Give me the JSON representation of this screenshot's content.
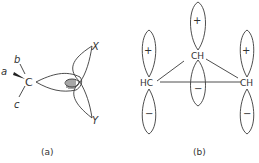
{
  "figure": {
    "panel_a": {
      "caption": "(a)",
      "atom": "C",
      "substituents": [
        "a",
        "b",
        "c"
      ],
      "lobe_labels": [
        "X",
        "Y"
      ]
    },
    "panel_b": {
      "caption": "(b)",
      "groups": [
        {
          "label": "HC",
          "upper_sign": "+",
          "lower_sign": "−"
        },
        {
          "label": "CH",
          "upper_sign": "+",
          "lower_sign": "−"
        },
        {
          "label": "CH",
          "upper_sign": "+",
          "lower_sign": "−"
        }
      ]
    }
  }
}
